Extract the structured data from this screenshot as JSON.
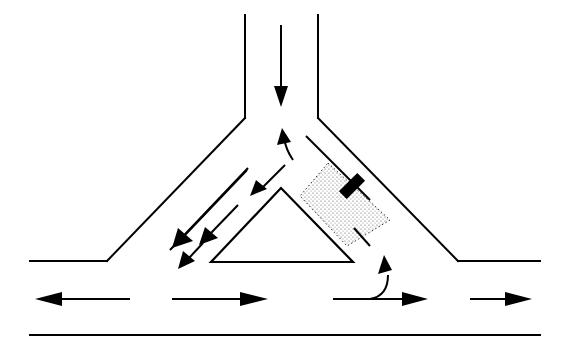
{
  "diagram": {
    "title": "",
    "type": "T-junction with triangular traffic island",
    "colors": {
      "line": "#000000",
      "background": "#ffffff",
      "zone_dots": "#555555"
    },
    "roads": {
      "vertical_left": {
        "x1": 245,
        "y1": 15,
        "x2": 245,
        "y2": 118
      },
      "vertical_right": {
        "x1": 318,
        "y1": 15,
        "x2": 318,
        "y2": 118
      },
      "left_diagonal": {
        "x1": 245,
        "y1": 118,
        "x2": 107,
        "y2": 261
      },
      "left_kerb": {
        "x1": 107,
        "y1": 261,
        "x2": 30,
        "y2": 261
      },
      "right_diagonal": {
        "x1": 318,
        "y1": 118,
        "x2": 458,
        "y2": 261
      },
      "right_kerb": {
        "x1": 458,
        "y1": 261,
        "x2": 540,
        "y2": 261
      },
      "bottom_edge": {
        "x1": 30,
        "y1": 335,
        "x2": 540,
        "y2": 335
      }
    },
    "lane_lines": [
      {
        "name": "left-lane-divider",
        "x1": 248,
        "y1": 168,
        "x2": 170,
        "y2": 250
      },
      {
        "name": "right-lane-divider",
        "x1": 306,
        "y1": 136,
        "x2": 370,
        "y2": 200
      },
      {
        "name": "right-lane-divider-tail",
        "x1": 354,
        "y1": 228,
        "x2": 370,
        "y2": 246
      }
    ],
    "island": {
      "apex": [
        281,
        188
      ],
      "base_left": [
        211,
        262
      ],
      "base_right": [
        353,
        262
      ]
    },
    "zone": {
      "points": "328,163 390,220 347,246 300,196"
    },
    "car": {
      "cx": 352,
      "cy": 186,
      "w": 11,
      "h": 26,
      "angle": 45
    },
    "arrows": [
      {
        "name": "southbound-arrow",
        "path": "M 281 25 L 281 90",
        "head": "281,107 274,86 288,86"
      },
      {
        "name": "merge-up-arrow",
        "path": "M 293 160 Q 286 150 284 138",
        "head": "282,128 277,145 291,142"
      },
      {
        "name": "left-turn-inner-arrow",
        "path": "M 285 165 L 262 188",
        "head": "250,196 256,180 267,189"
      },
      {
        "name": "left-turn-outer-arrow",
        "path": "M 247 170 L 185 235",
        "head": "172,248 178,228 193,241"
      },
      {
        "name": "left-turn-mid-arrow",
        "path": "M 238 205 L 211 233",
        "head": "199,245 205,227 218,238"
      },
      {
        "name": "left-turn-lower-arrow",
        "path": "M 203 243 L 189 258",
        "head": "178,269 183,251 195,261"
      },
      {
        "name": "westbound-arrow",
        "path": "M 130 299 L 62 299",
        "head": "35,299 62,292 62,306"
      },
      {
        "name": "eastbound-left-arrow",
        "path": "M 172 299 L 240 299",
        "head": "268,299 240,292 240,306"
      },
      {
        "name": "eastbound-right-arrow",
        "path": "M 333 299 L 402 299",
        "head": "428,299 402,292 402,306"
      },
      {
        "name": "eastbound-far-arrow",
        "path": "M 470 299 L 505 299",
        "head": "532,299 505,292 505,306"
      },
      {
        "name": "u-turn-up-arrow",
        "path": "M 370 299 Q 388 296 388 275",
        "head": "384,255 378,274 392,270"
      }
    ]
  }
}
